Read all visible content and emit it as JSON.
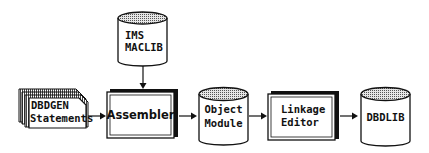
{
  "diagram": {
    "type": "flow",
    "nodes": {
      "maclib": {
        "shape": "cylinder",
        "line1": "IMS",
        "line2": "MACLIB"
      },
      "dbdgen": {
        "shape": "card-stack",
        "line1": "DBDGEN",
        "line2": "Statements"
      },
      "assembler": {
        "shape": "process-box",
        "label": "Assembler"
      },
      "object_module": {
        "shape": "cylinder",
        "line1": "Object",
        "line2": "Module"
      },
      "linkage_editor": {
        "shape": "process-box",
        "line1": "Linkage",
        "line2": "Editor"
      },
      "dbdlib": {
        "shape": "cylinder",
        "label": "DBDLIB"
      }
    },
    "edges": [
      {
        "from": "IMS MACLIB",
        "to": "Assembler"
      },
      {
        "from": "DBDGEN Statements",
        "to": "Assembler"
      },
      {
        "from": "Assembler",
        "to": "Object Module"
      },
      {
        "from": "Object Module",
        "to": "Linkage Editor"
      },
      {
        "from": "Linkage Editor",
        "to": "DBDLIB"
      }
    ],
    "colors": {
      "stroke": "#111111",
      "fill": "#ffffff",
      "cylinder_top": "#bdbdbd",
      "stack_shade": "#9a9a9a"
    }
  }
}
